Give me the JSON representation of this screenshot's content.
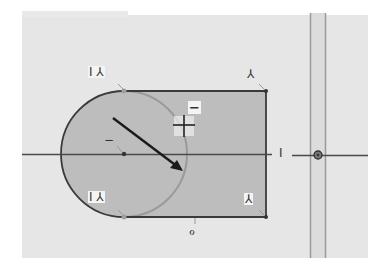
{
  "sketch": {
    "title": "",
    "colors": {
      "page_bg": "#ffffff",
      "canvas_bg": "#e6e6e6",
      "region_fill": "#bdbdbd",
      "profile_line": "#3a3a3a",
      "construction_circle": "#9a9a9a",
      "axis_line": "#4a4a4a",
      "vertical_band_fill": "#dcdcdc",
      "vertical_band_line": "#9b9b9b",
      "arrow": "#1a1a1a"
    },
    "constraints": [
      {
        "id": "tangent-top-left",
        "label": "I ⅄",
        "x": 88,
        "y": 66
      },
      {
        "id": "tangent-bottom-left",
        "label": "I ⅄",
        "x": 88,
        "y": 191
      },
      {
        "id": "corner-top-right",
        "label": "⅄",
        "x": 246,
        "y": 68
      },
      {
        "id": "corner-bottom-right",
        "label": "⅄",
        "x": 244,
        "y": 193
      },
      {
        "id": "horizontal-axis",
        "label": "I",
        "x": 278,
        "y": 147
      },
      {
        "id": "bottom-edge",
        "label": "ℴ",
        "x": 188,
        "y": 224
      },
      {
        "id": "circle-center-minus",
        "label": "−",
        "x": 103,
        "y": 134
      },
      {
        "id": "cursor-minus",
        "label": "−",
        "x": 189,
        "y": 101
      }
    ],
    "cursor": {
      "type": "crosshair-plus",
      "x": 184,
      "y": 125
    },
    "origin": {
      "x": 318,
      "y": 155
    }
  }
}
